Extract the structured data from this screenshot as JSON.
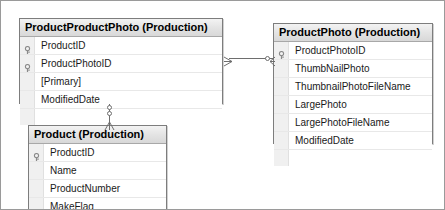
{
  "diagram": {
    "tables": [
      {
        "id": "product-product-photo",
        "header": "ProductProductPhoto (Production)",
        "fields": [
          {
            "name": "ProductID",
            "key": true
          },
          {
            "name": "ProductPhotoID",
            "key": true
          },
          {
            "name": "[Primary]",
            "key": false
          },
          {
            "name": "ModifiedDate",
            "key": false
          }
        ]
      },
      {
        "id": "product-photo",
        "header": "ProductPhoto (Production)",
        "fields": [
          {
            "name": "ProductPhotoID",
            "key": true
          },
          {
            "name": "ThumbNailPhoto",
            "key": false
          },
          {
            "name": "ThumbnailPhotoFileName",
            "key": false
          },
          {
            "name": "LargePhoto",
            "key": false
          },
          {
            "name": "LargePhotoFileName",
            "key": false
          },
          {
            "name": "ModifiedDate",
            "key": false
          }
        ]
      },
      {
        "id": "product",
        "header": "Product (Production)",
        "fields": [
          {
            "name": "ProductID",
            "key": true
          },
          {
            "name": "Name",
            "key": false
          },
          {
            "name": "ProductNumber",
            "key": false
          },
          {
            "name": "MakeFlag",
            "key": false
          }
        ]
      }
    ],
    "relationships": [
      {
        "id": "rel-ppp-to-photo",
        "from": "product-product-photo",
        "to": "product-photo",
        "orientation": "horizontal",
        "notation": "crows-foot"
      },
      {
        "id": "rel-ppp-to-product",
        "from": "product-product-photo",
        "to": "product",
        "orientation": "vertical",
        "notation": "crows-foot"
      }
    ],
    "colors": {
      "border": "#7d7d7d",
      "header_top": "#f3f3f3",
      "header_bottom": "#d8d8d8",
      "gutter": "#f0f0f0",
      "connector": "#6e6e6e",
      "key_icon": "#8a8a8a",
      "text": "#1a1a1a",
      "canvas_border": "#9a9a9a"
    }
  }
}
